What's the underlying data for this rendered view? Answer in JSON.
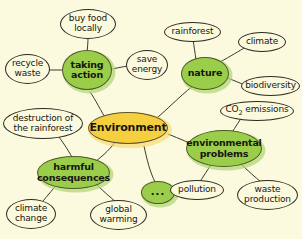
{
  "diagram": {
    "background_color": "#fbfadf",
    "center_color": "#f6cf3f",
    "branch_color": "#9acd4a",
    "leaf_color": "#fbfadf",
    "outline_color": "#2c2a20"
  },
  "center": {
    "label": "Environment"
  },
  "branches": [
    {
      "id": "taking-action",
      "label": "taking\naction"
    },
    {
      "id": "nature",
      "label": "nature"
    },
    {
      "id": "environmental-problems",
      "label": "environmental\nproblems"
    },
    {
      "id": "harmful-consequences",
      "label": "harmful\nconsequences"
    },
    {
      "id": "ellipsis",
      "label": "..."
    }
  ],
  "leaves": [
    {
      "id": "buy-food-locally",
      "label": "buy food\nlocally",
      "parent": "taking-action"
    },
    {
      "id": "recycle-waste",
      "label": "recycle\nwaste",
      "parent": "taking-action"
    },
    {
      "id": "save-energy",
      "label": "save\nenergy",
      "parent": "taking-action"
    },
    {
      "id": "rainforest",
      "label": "rainforest",
      "parent": "nature"
    },
    {
      "id": "climate",
      "label": "climate",
      "parent": "nature"
    },
    {
      "id": "biodiversity",
      "label": "biodiversity",
      "parent": "nature"
    },
    {
      "id": "co2-emissions",
      "label": "CO2 emissions",
      "parent": "environmental-problems"
    },
    {
      "id": "pollution",
      "label": "pollution",
      "parent": "environmental-problems"
    },
    {
      "id": "waste-production",
      "label": "waste\nproduction",
      "parent": "environmental-problems"
    },
    {
      "id": "destruction-of-the-rainforest",
      "label": "destruction of\nthe rainforest",
      "parent": "harmful-consequences"
    },
    {
      "id": "climate-change",
      "label": "climate\nchange",
      "parent": "harmful-consequences"
    },
    {
      "id": "global-warming",
      "label": "global\nwarming",
      "parent": "harmful-consequences"
    }
  ]
}
